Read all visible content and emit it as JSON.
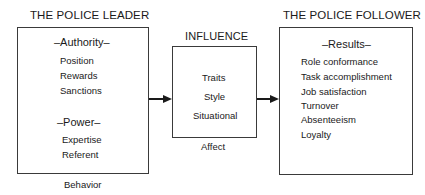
{
  "leader": {
    "title": "THE POLICE LEADER",
    "authority_header": "–Authority–",
    "authority_items": [
      "Position",
      "Rewards",
      "Sanctions"
    ],
    "power_header": "–Power–",
    "power_items": [
      "Expertise",
      "Referent"
    ],
    "caption": "Behavior"
  },
  "influence": {
    "title": "INFLUENCE",
    "items": [
      "Traits",
      "Style",
      "Situational"
    ],
    "caption": "Affect"
  },
  "follower": {
    "title": "THE POLICE FOLLOWER",
    "results_header": "–Results–",
    "results_items": [
      "Role conformance",
      "Task accomplishment",
      "Job satisfaction",
      "Turnover",
      "Absenteeism",
      "Loyalty"
    ]
  },
  "colors": {
    "line": "#1a1a1a",
    "box_border": "#3a3a3a",
    "background": "#ffffff"
  }
}
